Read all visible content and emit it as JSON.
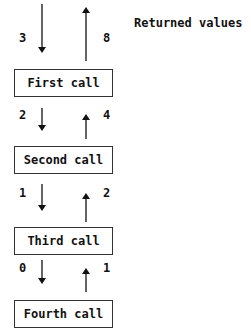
{
  "title": "Returned values",
  "calls": [
    {
      "label": "First call",
      "arg": "3",
      "returned": "8"
    },
    {
      "label": "Second call",
      "arg": "2",
      "returned": "4"
    },
    {
      "label": "Third call",
      "arg": "1",
      "returned": "2"
    },
    {
      "label": "Fourth call",
      "arg": "0",
      "returned": "1"
    }
  ]
}
